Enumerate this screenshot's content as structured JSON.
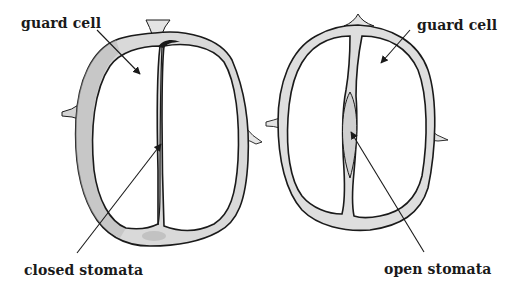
{
  "diagram": {
    "colors": {
      "background": "#ffffff",
      "outline": "#1a1a1a",
      "wall_fill": "#d9d9d9",
      "wall_fill_dark": "#b8b8b8",
      "cell_fill": "#ffffff"
    },
    "labels": {
      "left_guard_cell": "guard cell",
      "left_stomata": "closed stomata",
      "right_guard_cell": "guard cell",
      "right_stomata": "open stomata"
    },
    "panels": [
      {
        "id": "left",
        "state": "closed",
        "guard_cell_label": "guard cell",
        "stomata_label": "closed stomata"
      },
      {
        "id": "right",
        "state": "open",
        "guard_cell_label": "guard cell",
        "stomata_label": "open stomata"
      }
    ]
  }
}
